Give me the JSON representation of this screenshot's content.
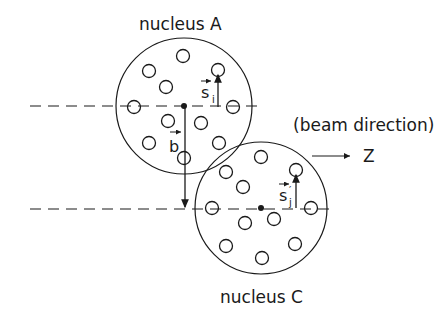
{
  "diagram": {
    "labels": {
      "nucleus_a": "nucleus A",
      "nucleus_c": "nucleus C",
      "beam_direction": "(beam direction)",
      "z_axis": "Z",
      "impact_vector": "b",
      "s_i": "s",
      "s_i_sub": "i",
      "s_j": "s",
      "s_j_prime": "′",
      "s_j_sub": "j"
    },
    "nucleus_a": {
      "center": [
        184,
        106
      ],
      "radius": 68,
      "nucleons": [
        [
          183,
          56
        ],
        [
          149,
          71
        ],
        [
          166,
          87
        ],
        [
          218,
          70
        ],
        [
          134,
          107
        ],
        [
          233,
          107
        ],
        [
          168,
          121
        ],
        [
          201,
          123
        ],
        [
          149,
          143
        ],
        [
          219,
          143
        ],
        [
          184,
          158
        ]
      ]
    },
    "nucleus_c": {
      "center": [
        261,
        208
      ],
      "radius": 66,
      "nucleons": [
        [
          261,
          157
        ],
        [
          226,
          172
        ],
        [
          243,
          187
        ],
        [
          296,
          170
        ],
        [
          212,
          208
        ],
        [
          311,
          208
        ],
        [
          245,
          223
        ],
        [
          274,
          219
        ],
        [
          226,
          246
        ],
        [
          295,
          244
        ],
        [
          262,
          258
        ]
      ]
    },
    "colors": {
      "ink": "#1a1a1a",
      "background": "#ffffff"
    }
  }
}
